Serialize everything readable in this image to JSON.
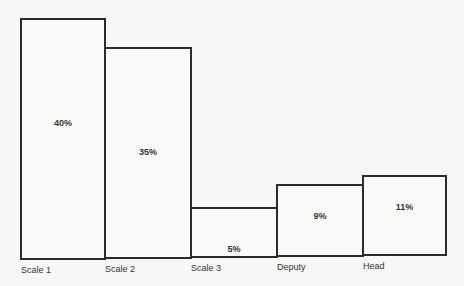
{
  "chart_data": {
    "type": "bar",
    "title": "",
    "xlabel": "",
    "ylabel": "",
    "categories": [
      "Scale 1",
      "Scale 2",
      "Scale 3",
      "Deputy",
      "Head"
    ],
    "values": [
      40,
      35,
      5,
      9,
      11
    ],
    "value_labels": [
      "40%",
      "35%",
      "5%",
      "9%",
      "11%"
    ],
    "unit": "%",
    "ylim": [
      0,
      40
    ],
    "grid": false,
    "legend": null,
    "bar_style": "outlined, adjacent (no gaps)",
    "colors": {
      "outline": "#2b2b2b",
      "fill": "#fafaf8",
      "background": "#f7f7f5"
    }
  }
}
